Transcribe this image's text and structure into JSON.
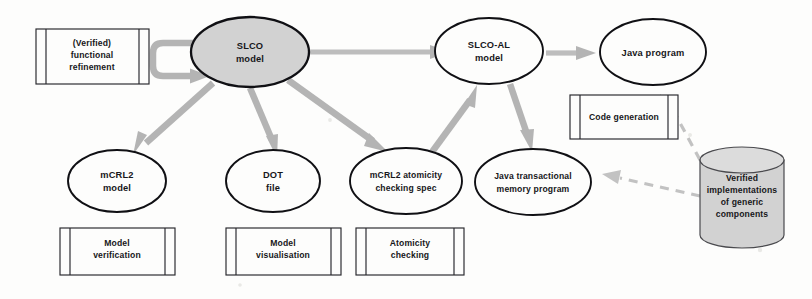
{
  "diagram": {
    "colors": {
      "shaded_fill": "#d2d2d2",
      "node_stroke": "#101014",
      "arrow_gray": "#b4b4b4",
      "dashed_gray": "#c2c2c2",
      "background": "#fdfdfc",
      "text": "#17171a"
    },
    "nodes": {
      "slco_model": {
        "label_line1": "SLCO",
        "label_line2": "model",
        "shape": "ellipse",
        "fill": "shaded"
      },
      "slco_al_model": {
        "label_line1": "SLCO-AL",
        "label_line2": "model",
        "shape": "ellipse",
        "fill": "white"
      },
      "java_program": {
        "label_line1": "Java program",
        "label_line2": "",
        "shape": "ellipse",
        "fill": "white"
      },
      "mcrl2_model": {
        "label_line1": "mCRL2",
        "label_line2": "model",
        "shape": "ellipse",
        "fill": "white"
      },
      "dot_file": {
        "label_line1": "DOT",
        "label_line2": "file",
        "shape": "ellipse",
        "fill": "white"
      },
      "mcrl2_atomicity_spec": {
        "label_line1": "mCRL2 atomicity",
        "label_line2": "checking spec",
        "shape": "ellipse",
        "fill": "white"
      },
      "java_tm_program": {
        "label_line1": "Java transactional",
        "label_line2": "memory program",
        "shape": "ellipse",
        "fill": "white"
      },
      "verified_components": {
        "label_line1": "Verified",
        "label_line2": "implementations",
        "label_line3": "of generic",
        "label_line4": "components",
        "shape": "cylinder",
        "fill": "shaded"
      }
    },
    "process_boxes": {
      "functional_refinement": {
        "line1": "(Verified)",
        "line2": "functional",
        "line3": "refinement"
      },
      "model_verification": {
        "line1": "Model",
        "line2": "verification"
      },
      "model_visualisation": {
        "line1": "Model",
        "line2": "visualisation"
      },
      "atomicity_checking": {
        "line1": "Atomicity",
        "line2": "checking"
      },
      "code_generation": {
        "line1": "Code generation",
        "line2": ""
      }
    },
    "edges": [
      {
        "name": "slco-self-loop",
        "from": "slco_model",
        "to": "slco_model",
        "style": "solid-gray"
      },
      {
        "name": "slco-to-slco-al",
        "from": "slco_model",
        "to": "slco_al_model",
        "style": "solid-gray"
      },
      {
        "name": "slco-al-to-java",
        "from": "slco_al_model",
        "to": "java_program",
        "style": "solid-gray"
      },
      {
        "name": "slco-to-mcrl2-model",
        "from": "slco_model",
        "to": "mcrl2_model",
        "style": "solid-gray"
      },
      {
        "name": "slco-to-dot-file",
        "from": "slco_model",
        "to": "dot_file",
        "style": "solid-gray"
      },
      {
        "name": "slco-to-atomicity-spec",
        "from": "slco_model",
        "to": "mcrl2_atomicity_spec",
        "style": "solid-gray"
      },
      {
        "name": "atomicity-spec-to-slco-al",
        "from": "mcrl2_atomicity_spec",
        "to": "slco_al_model",
        "style": "solid-gray"
      },
      {
        "name": "slco-al-to-java-tm",
        "from": "slco_al_model",
        "to": "java_tm_program",
        "style": "solid-gray"
      },
      {
        "name": "components-to-java",
        "from": "verified_components",
        "to": "java_program",
        "style": "dashed-gray"
      },
      {
        "name": "components-to-java-tm",
        "from": "verified_components",
        "to": "java_tm_program",
        "style": "dashed-gray"
      }
    ]
  }
}
